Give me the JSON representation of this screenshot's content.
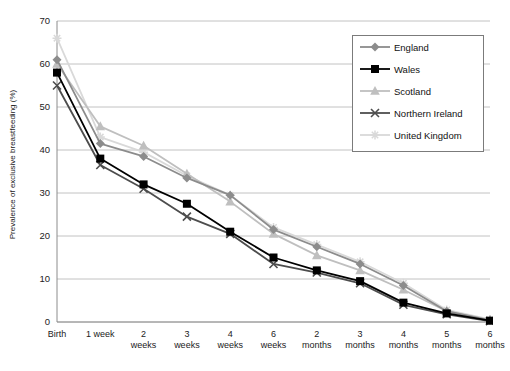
{
  "chart_data": {
    "type": "line",
    "title": "",
    "xlabel": "",
    "ylabel": "Prevalence of exclusive breastfeeding (%)",
    "ylim": [
      0,
      70
    ],
    "ytick_values": [
      0,
      10,
      20,
      30,
      40,
      50,
      60,
      70
    ],
    "grid": "horizontal",
    "legend_position": "top-right",
    "categories": [
      "Birth",
      "1 week",
      "2 weeks",
      "3 weeks",
      "4 weeks",
      "6 weeks",
      "2 months",
      "3 months",
      "4 months",
      "5 months",
      "6 months"
    ],
    "category_lines": [
      [
        "Birth"
      ],
      [
        "1 week"
      ],
      [
        "2",
        "weeks"
      ],
      [
        "3",
        "weeks"
      ],
      [
        "4",
        "weeks"
      ],
      [
        "6",
        "weeks"
      ],
      [
        "2",
        "months"
      ],
      [
        "3",
        "months"
      ],
      [
        "4",
        "months"
      ],
      [
        "5",
        "months"
      ],
      [
        "6",
        "months"
      ]
    ],
    "series": [
      {
        "name": "England",
        "color": "#8c8c8c",
        "marker": "diamond",
        "values": [
          61,
          41.5,
          38.5,
          33.5,
          29.5,
          21.5,
          17.5,
          13.5,
          8.5,
          2.5,
          0.4
        ]
      },
      {
        "name": "Wales",
        "color": "#000000",
        "marker": "square",
        "values": [
          58,
          38,
          32,
          27.5,
          21,
          15,
          12,
          9.5,
          4.5,
          2,
          0.3
        ]
      },
      {
        "name": "Scotland",
        "color": "#bfbfbf",
        "marker": "triangle",
        "values": [
          60,
          45.5,
          41,
          34.5,
          28,
          20.5,
          15.5,
          12,
          7.5,
          2.5,
          0.5
        ]
      },
      {
        "name": "Northern Ireland",
        "color": "#4d4d4d",
        "marker": "cross",
        "values": [
          55,
          36.5,
          31,
          24.5,
          20.5,
          13.5,
          11.5,
          9,
          4,
          1.8,
          0.2
        ]
      },
      {
        "name": "United Kingdom",
        "color": "#d9d9d9",
        "marker": "star",
        "values": [
          66,
          43,
          39.5,
          34,
          29.5,
          22,
          18,
          14,
          9,
          2.8,
          0.6
        ]
      }
    ]
  },
  "legend": {
    "items": [
      {
        "label": "England"
      },
      {
        "label": "Wales"
      },
      {
        "label": "Scotland"
      },
      {
        "label": "Northern Ireland"
      },
      {
        "label": "United Kingdom"
      }
    ]
  }
}
